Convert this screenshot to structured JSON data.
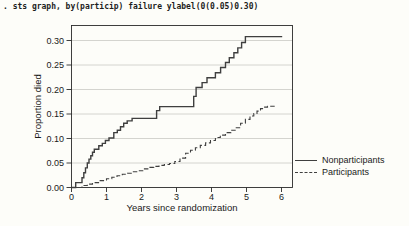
{
  "command_line": ". sts graph, by(particip) failure ylabel(0(0.05)0.30)",
  "colors": {
    "background": "#fdfdf9",
    "plot_fill": "#ffffff",
    "axis": "#2a2a2a",
    "grid": "#cfcfca",
    "curve": "#3f3f3f",
    "text": "#1a1a1a"
  },
  "chart_data": {
    "type": "line",
    "subtype": "kaplan-meier-failure-step",
    "title": "",
    "xlabel": "Years since randomization",
    "ylabel": "Proportion died",
    "xlim": [
      0,
      6.35
    ],
    "ylim": [
      0,
      0.332
    ],
    "xticks": [
      0,
      1,
      2,
      3,
      4,
      5,
      6
    ],
    "yticks": [
      0.0,
      0.05,
      0.1,
      0.15,
      0.2,
      0.25,
      0.3
    ],
    "ytick_labels": [
      "0.00",
      "0.05",
      "0.10",
      "0.15",
      "0.20",
      "0.25",
      "0.30"
    ],
    "grid": true,
    "legend_position": "right-outside",
    "series": [
      {
        "name": "Nonparticipants",
        "style": "solid",
        "color": "#3f3f3f",
        "points": [
          [
            0.0,
            0.0
          ],
          [
            0.12,
            0.01
          ],
          [
            0.3,
            0.02
          ],
          [
            0.35,
            0.03
          ],
          [
            0.4,
            0.04
          ],
          [
            0.45,
            0.05
          ],
          [
            0.5,
            0.058
          ],
          [
            0.55,
            0.065
          ],
          [
            0.6,
            0.072
          ],
          [
            0.65,
            0.078
          ],
          [
            0.78,
            0.085
          ],
          [
            0.88,
            0.09
          ],
          [
            0.97,
            0.096
          ],
          [
            1.07,
            0.101
          ],
          [
            1.21,
            0.112
          ],
          [
            1.31,
            0.117
          ],
          [
            1.4,
            0.124
          ],
          [
            1.49,
            0.131
          ],
          [
            1.59,
            0.136
          ],
          [
            1.73,
            0.141
          ],
          [
            2.43,
            0.157
          ],
          [
            2.52,
            0.165
          ],
          [
            3.49,
            0.186
          ],
          [
            3.56,
            0.204
          ],
          [
            3.73,
            0.214
          ],
          [
            3.87,
            0.224
          ],
          [
            4.11,
            0.234
          ],
          [
            4.26,
            0.245
          ],
          [
            4.4,
            0.255
          ],
          [
            4.51,
            0.265
          ],
          [
            4.64,
            0.275
          ],
          [
            4.75,
            0.285
          ],
          [
            4.86,
            0.296
          ],
          [
            4.97,
            0.308
          ],
          [
            6.02,
            0.308
          ]
        ]
      },
      {
        "name": "Participants",
        "style": "dashed",
        "color": "#3f3f3f",
        "points": [
          [
            0.0,
            0.0
          ],
          [
            0.3,
            0.004
          ],
          [
            0.45,
            0.007
          ],
          [
            0.6,
            0.01
          ],
          [
            0.8,
            0.014
          ],
          [
            1.0,
            0.018
          ],
          [
            1.15,
            0.021
          ],
          [
            1.3,
            0.024
          ],
          [
            1.45,
            0.027
          ],
          [
            1.6,
            0.029
          ],
          [
            1.75,
            0.032
          ],
          [
            1.9,
            0.034
          ],
          [
            2.05,
            0.038
          ],
          [
            2.2,
            0.041
          ],
          [
            2.35,
            0.043
          ],
          [
            2.5,
            0.045
          ],
          [
            2.65,
            0.047
          ],
          [
            2.8,
            0.049
          ],
          [
            2.95,
            0.053
          ],
          [
            3.1,
            0.06
          ],
          [
            3.26,
            0.07
          ],
          [
            3.4,
            0.076
          ],
          [
            3.54,
            0.081
          ],
          [
            3.68,
            0.086
          ],
          [
            3.83,
            0.091
          ],
          [
            3.97,
            0.096
          ],
          [
            4.11,
            0.102
          ],
          [
            4.25,
            0.107
          ],
          [
            4.4,
            0.112
          ],
          [
            4.55,
            0.117
          ],
          [
            4.69,
            0.122
          ],
          [
            4.83,
            0.131
          ],
          [
            4.97,
            0.139
          ],
          [
            5.1,
            0.146
          ],
          [
            5.21,
            0.151
          ],
          [
            5.3,
            0.156
          ],
          [
            5.4,
            0.161
          ],
          [
            5.5,
            0.164
          ],
          [
            5.6,
            0.166
          ],
          [
            5.83,
            0.166
          ]
        ]
      }
    ]
  }
}
